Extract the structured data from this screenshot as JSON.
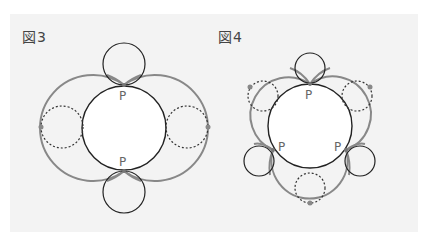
{
  "figures": [
    {
      "label": "図3",
      "point_label": "P",
      "points": [
        "P",
        "P"
      ]
    },
    {
      "label": "図4",
      "point_label": "P",
      "points": [
        "P",
        "P",
        "P"
      ]
    }
  ],
  "colors": {
    "background": "#f3f3f3",
    "gray_arc": "#888888",
    "circle_stroke": "#222222",
    "dotted_stroke": "#333333",
    "dot_fill": "#888888",
    "label_text": "#444444",
    "point_text": "#666666"
  }
}
